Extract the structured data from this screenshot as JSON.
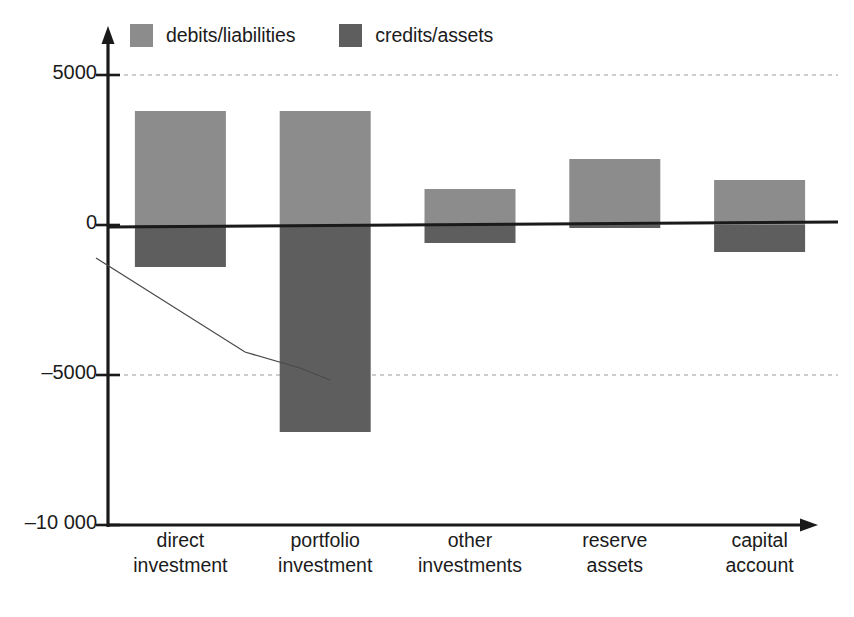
{
  "chart_data": {
    "type": "bar",
    "title": "",
    "subtitle": "",
    "xlabel": "",
    "ylabel": "",
    "orientation": "vertical",
    "grid": "horizontal dashed gridlines at 5000 and -5000",
    "legend_position": "top",
    "categories": [
      "direct investment",
      "portfolio investment",
      "other investments",
      "reserve assets",
      "capital account"
    ],
    "category_lines": [
      [
        "direct",
        "investment"
      ],
      [
        "portfolio",
        "investment"
      ],
      [
        "other",
        "investments"
      ],
      [
        "reserve",
        "assets"
      ],
      [
        "capital",
        "account"
      ]
    ],
    "series": [
      {
        "name": "debits/liabilities",
        "color": "#8c8c8c",
        "values": [
          3800,
          3800,
          1200,
          2200,
          1500
        ]
      },
      {
        "name": "credits/assets",
        "color": "#5e5e5e",
        "values": [
          -1400,
          -6900,
          -600,
          -100,
          -900
        ]
      }
    ],
    "ylim": [
      -10000,
      6500
    ],
    "yticks": [
      5000,
      0,
      -5000,
      -10000
    ],
    "ytick_labels": [
      "5000",
      "0",
      "–5000",
      "–10 000"
    ],
    "annotations": [
      {
        "name": "trend-line",
        "description": "thin descending line from near axis down to the right",
        "points": [
          [
            -1200,
            -5200
          ]
        ]
      },
      {
        "name": "zero-baseline",
        "description": "slightly sloped heavy horizontal line through 0"
      }
    ]
  },
  "legend": {
    "entries": [
      {
        "label": "debits/liabilities",
        "color": "#8c8c8c"
      },
      {
        "label": "credits/assets",
        "color": "#5e5e5e"
      }
    ]
  },
  "axis": {
    "y": {
      "ticks": [
        {
          "label": "5000"
        },
        {
          "label": "0"
        },
        {
          "label": "–5000"
        },
        {
          "label": "–10 000"
        }
      ]
    },
    "x": {
      "ticks": [
        {
          "line1": "direct",
          "line2": "investment"
        },
        {
          "line1": "portfolio",
          "line2": "investment"
        },
        {
          "line1": "other",
          "line2": "investments"
        },
        {
          "line1": "reserve",
          "line2": "assets"
        },
        {
          "line1": "capital",
          "line2": "account"
        }
      ]
    }
  },
  "colors": {
    "debits": "#8c8c8c",
    "credits": "#5e5e5e",
    "axis": "#1a1a1a",
    "grid": "#bdbdbd",
    "background": "#ffffff"
  }
}
